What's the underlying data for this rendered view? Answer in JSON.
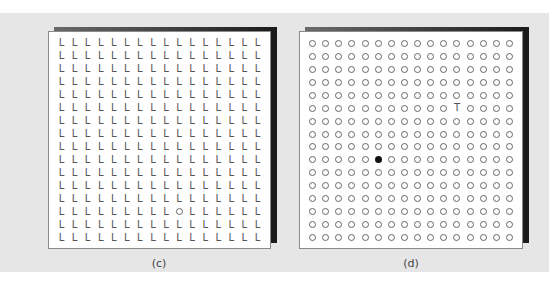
{
  "figure": {
    "background_color": "#e6e6e6",
    "panels": [
      {
        "id": "c",
        "caption": "(c)",
        "rows": 16,
        "cols": 16,
        "distractor_glyph": "L",
        "target": {
          "glyph": "O",
          "row": 14,
          "col": 10
        }
      },
      {
        "id": "d",
        "caption": "(d)",
        "rows": 16,
        "cols": 16,
        "distractor_glyph": "ring",
        "targets": [
          {
            "glyph": "T",
            "row": 6,
            "col": 12
          },
          {
            "glyph": "filled-dot",
            "row": 10,
            "col": 6
          }
        ]
      }
    ]
  }
}
